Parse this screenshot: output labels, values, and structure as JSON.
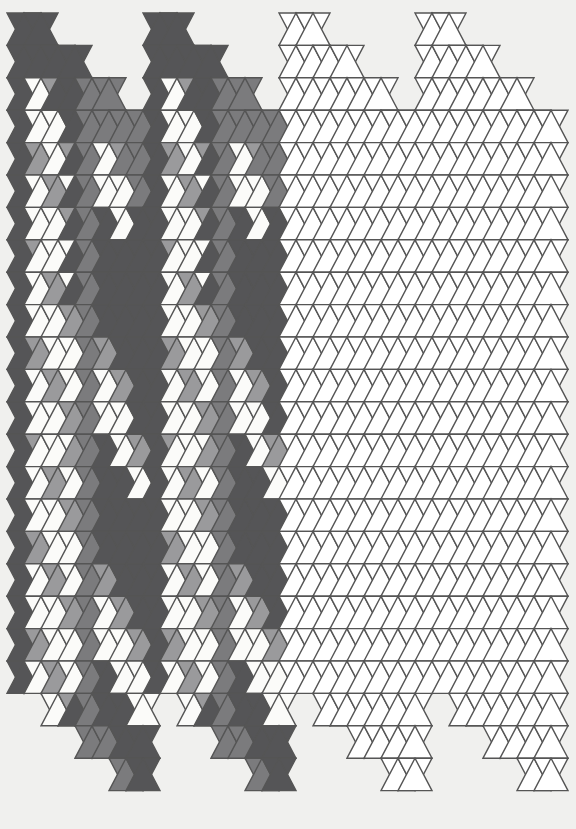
{
  "artwork": {
    "title": "Isometric Triangle Tiling",
    "type": "geometric-tiling",
    "canvas": {
      "width": 576,
      "height": 829,
      "background": "#f0f0ee"
    },
    "geometry": {
      "description": "Isometric triangular grid rendered as four vertical panels; each panel is sheared so its top and bottom edges form a descending staircase. Triangles alternate up-pointing and down-pointing across each row.",
      "origin_x": 7,
      "origin_y": 13,
      "half_width": 17,
      "row_height": 32.4,
      "rows": 25,
      "panel_half_columns": 8,
      "panel_count": 4,
      "panel_stagger_rows": 4,
      "panel_gap": 0,
      "stroke": "#555555",
      "stroke_width": 1.4
    },
    "palette": {
      "dark": "#555557",
      "mid": "#7b7b7d",
      "light": "#9a9a9c",
      "pale": "#b5b5b6",
      "white": "#fbfbf9",
      "outline_only": "#ffffff",
      "background": "#f0f0ee",
      "stroke": "#555557"
    },
    "panels": [
      {
        "name": "panel-1",
        "index": 0,
        "shaded": true,
        "start_row_offset": 0
      },
      {
        "name": "panel-2",
        "index": 1,
        "shaded": true,
        "start_row_offset": 0
      },
      {
        "name": "panel-3",
        "index": 2,
        "shaded": false,
        "start_row_offset": 0
      },
      {
        "name": "panel-4",
        "index": 3,
        "shaded": false,
        "start_row_offset": 0
      }
    ],
    "fill_codes": {
      "0": "white",
      "1": "pale",
      "2": "light",
      "3": "mid",
      "4": "dark"
    },
    "pattern_rows": [
      [
        4,
        4,
        4,
        4,
        4,
        4,
        4,
        4,
        3,
        3,
        4,
        4,
        4,
        4,
        4,
        4
      ],
      [
        4,
        4,
        4,
        4,
        4,
        4,
        4,
        4,
        3,
        3,
        3,
        3,
        4,
        4,
        4,
        4
      ],
      [
        4,
        4,
        0,
        0,
        2,
        4,
        4,
        4,
        3,
        3,
        3,
        3,
        3,
        3,
        4,
        4
      ],
      [
        4,
        4,
        0,
        0,
        0,
        0,
        4,
        4,
        3,
        3,
        3,
        3,
        3,
        3,
        3,
        3
      ],
      [
        4,
        4,
        2,
        2,
        0,
        0,
        2,
        4,
        3,
        3,
        0,
        0,
        2,
        3,
        3,
        3
      ],
      [
        4,
        4,
        0,
        0,
        2,
        2,
        0,
        4,
        3,
        3,
        0,
        0,
        0,
        0,
        3,
        3
      ],
      [
        4,
        4,
        0,
        0,
        0,
        0,
        2,
        4,
        3,
        3,
        4,
        4,
        0,
        0,
        4,
        4
      ],
      [
        4,
        4,
        2,
        0,
        0,
        0,
        0,
        4,
        3,
        3,
        4,
        4,
        4,
        4,
        4,
        4
      ],
      [
        4,
        4,
        0,
        0,
        2,
        2,
        0,
        4,
        3,
        3,
        4,
        4,
        4,
        4,
        4,
        4
      ],
      [
        4,
        4,
        0,
        0,
        0,
        0,
        2,
        2,
        3,
        3,
        4,
        4,
        4,
        4,
        4,
        4
      ],
      [
        4,
        4,
        2,
        2,
        0,
        0,
        0,
        0,
        3,
        3,
        2,
        2,
        4,
        4,
        4,
        4
      ],
      [
        4,
        4,
        0,
        0,
        2,
        2,
        0,
        0,
        3,
        3,
        0,
        0,
        2,
        2,
        4,
        4
      ],
      [
        4,
        4,
        0,
        0,
        0,
        0,
        2,
        2,
        3,
        3,
        0,
        0,
        0,
        0,
        4,
        4
      ],
      [
        4,
        4,
        2,
        0,
        0,
        0,
        0,
        2,
        3,
        3,
        4,
        4,
        0,
        0,
        2,
        2
      ],
      [
        4,
        4,
        0,
        0,
        2,
        2,
        0,
        0,
        3,
        3,
        4,
        4,
        4,
        4,
        0,
        0
      ],
      [
        4,
        4,
        0,
        0,
        0,
        0,
        2,
        2,
        3,
        3,
        4,
        4,
        4,
        4,
        4,
        4
      ],
      [
        4,
        4,
        2,
        2,
        0,
        0,
        0,
        0,
        3,
        3,
        4,
        4,
        4,
        4,
        4,
        4
      ],
      [
        4,
        4,
        0,
        0,
        2,
        2,
        0,
        0,
        3,
        3,
        2,
        2,
        4,
        4,
        4,
        4
      ],
      [
        4,
        4,
        0,
        0,
        0,
        0,
        2,
        2,
        3,
        3,
        0,
        0,
        2,
        2,
        4,
        4
      ],
      [
        4,
        4,
        2,
        2,
        0,
        0,
        0,
        0,
        3,
        3,
        0,
        0,
        0,
        0,
        2,
        2
      ],
      [
        4,
        4,
        0,
        0,
        2,
        2,
        0,
        0,
        3,
        3,
        4,
        4,
        0,
        0,
        0,
        0
      ],
      [
        4,
        4,
        0,
        0,
        0,
        0,
        2,
        4,
        3,
        3,
        4,
        4,
        4,
        4,
        0,
        0
      ],
      [
        4,
        4,
        4,
        4,
        0,
        0,
        4,
        4,
        3,
        3,
        3,
        3,
        4,
        4,
        4,
        4
      ],
      [
        4,
        4,
        4,
        4,
        4,
        4,
        4,
        4,
        3,
        3,
        3,
        3,
        3,
        3,
        4,
        4
      ],
      [
        4,
        4,
        4,
        4,
        4,
        4,
        4,
        4,
        3,
        3,
        3,
        3,
        3,
        3,
        3,
        3
      ]
    ]
  }
}
